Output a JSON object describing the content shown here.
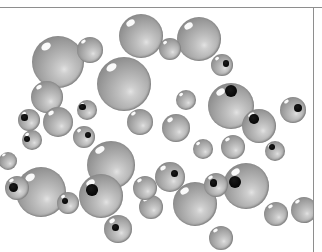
{
  "figure": {
    "kind": "space-filling-molecular-model",
    "caption": "",
    "background_color": "#ffffff",
    "border_color": "#8e8e8e",
    "sphere_base_color": "#a8a8a8",
    "sphere_highlight_color": "#ffffff",
    "sphere_shadow_color": "#6e6e6e",
    "pit_color": "#000000",
    "frame": {
      "top_rule_y": 7,
      "right_rule_x": 313,
      "width": 322,
      "height": 252
    },
    "atom_count": 38,
    "atoms": [
      {
        "id": "a01",
        "cx": 58,
        "cy": 62,
        "r": 26,
        "pit": null
      },
      {
        "id": "a02",
        "cx": 90,
        "cy": 50,
        "r": 13,
        "pit": null
      },
      {
        "id": "a03",
        "cx": 47,
        "cy": 97,
        "r": 16,
        "pit": null
      },
      {
        "id": "a04",
        "cx": 29,
        "cy": 120,
        "r": 11,
        "pit": {
          "ax": 30,
          "ay": 38,
          "ar": 30
        }
      },
      {
        "id": "a05",
        "cx": 58,
        "cy": 122,
        "r": 15,
        "pit": null
      },
      {
        "id": "a06",
        "cx": 87,
        "cy": 110,
        "r": 10,
        "pit": {
          "ax": 28,
          "ay": 36,
          "ar": 32
        }
      },
      {
        "id": "a07",
        "cx": 124,
        "cy": 84,
        "r": 27,
        "pit": null
      },
      {
        "id": "a08",
        "cx": 141,
        "cy": 36,
        "r": 22,
        "pit": null
      },
      {
        "id": "a09",
        "cx": 170,
        "cy": 49,
        "r": 11,
        "pit": null
      },
      {
        "id": "a10",
        "cx": 199,
        "cy": 39,
        "r": 22,
        "pit": null
      },
      {
        "id": "a11",
        "cx": 222,
        "cy": 65,
        "r": 11,
        "pit": {
          "ax": 68,
          "ay": 42,
          "ar": 30
        }
      },
      {
        "id": "a12",
        "cx": 186,
        "cy": 100,
        "r": 10,
        "pit": null
      },
      {
        "id": "a13",
        "cx": 140,
        "cy": 122,
        "r": 13,
        "pit": null
      },
      {
        "id": "a14",
        "cx": 176,
        "cy": 128,
        "r": 14,
        "pit": null
      },
      {
        "id": "a15",
        "cx": 231,
        "cy": 106,
        "r": 23,
        "pit": {
          "ax": 50,
          "ay": 18,
          "ar": 26
        }
      },
      {
        "id": "a16",
        "cx": 259,
        "cy": 126,
        "r": 17,
        "pit": {
          "ax": 36,
          "ay": 30,
          "ar": 28
        }
      },
      {
        "id": "a17",
        "cx": 293,
        "cy": 110,
        "r": 13,
        "pit": {
          "ax": 70,
          "ay": 42,
          "ar": 30
        }
      },
      {
        "id": "a18",
        "cx": 275,
        "cy": 151,
        "r": 10,
        "pit": {
          "ax": 34,
          "ay": 30,
          "ar": 30
        }
      },
      {
        "id": "a19",
        "cx": 32,
        "cy": 140,
        "r": 10,
        "pit": {
          "ax": 26,
          "ay": 44,
          "ar": 32
        }
      },
      {
        "id": "a20",
        "cx": 84,
        "cy": 137,
        "r": 11,
        "pit": {
          "ax": 68,
          "ay": 40,
          "ar": 30
        }
      },
      {
        "id": "a21",
        "cx": 41,
        "cy": 192,
        "r": 25,
        "pit": null
      },
      {
        "id": "a22",
        "cx": 17,
        "cy": 188,
        "r": 12,
        "pit": {
          "ax": 36,
          "ay": 48,
          "ar": 40
        }
      },
      {
        "id": "a23",
        "cx": 111,
        "cy": 165,
        "r": 24,
        "pit": null
      },
      {
        "id": "a24",
        "cx": 101,
        "cy": 196,
        "r": 22,
        "pit": {
          "ax": 30,
          "ay": 36,
          "ar": 26
        }
      },
      {
        "id": "a25",
        "cx": 68,
        "cy": 203,
        "r": 11,
        "pit": {
          "ax": 36,
          "ay": 40,
          "ar": 30
        }
      },
      {
        "id": "a26",
        "cx": 118,
        "cy": 229,
        "r": 14,
        "pit": {
          "ax": 40,
          "ay": 44,
          "ar": 26
        }
      },
      {
        "id": "a27",
        "cx": 151,
        "cy": 207,
        "r": 12,
        "pit": null
      },
      {
        "id": "a28",
        "cx": 170,
        "cy": 177,
        "r": 15,
        "pit": {
          "ax": 66,
          "ay": 38,
          "ar": 24
        }
      },
      {
        "id": "a29",
        "cx": 145,
        "cy": 188,
        "r": 12,
        "pit": null
      },
      {
        "id": "a30",
        "cx": 195,
        "cy": 204,
        "r": 22,
        "pit": null
      },
      {
        "id": "a31",
        "cx": 216,
        "cy": 185,
        "r": 12,
        "pit": {
          "ax": 38,
          "ay": 42,
          "ar": 30
        }
      },
      {
        "id": "a32",
        "cx": 221,
        "cy": 238,
        "r": 12,
        "pit": null
      },
      {
        "id": "a33",
        "cx": 246,
        "cy": 186,
        "r": 23,
        "pit": {
          "ax": 26,
          "ay": 42,
          "ar": 26
        }
      },
      {
        "id": "a34",
        "cx": 276,
        "cy": 214,
        "r": 12,
        "pit": null
      },
      {
        "id": "a35",
        "cx": 233,
        "cy": 147,
        "r": 12,
        "pit": null
      },
      {
        "id": "a36",
        "cx": 203,
        "cy": 149,
        "r": 10,
        "pit": null
      },
      {
        "id": "a37",
        "cx": 304,
        "cy": 210,
        "r": 13,
        "pit": null
      },
      {
        "id": "a38",
        "cx": 8,
        "cy": 161,
        "r": 9,
        "pit": null
      }
    ]
  }
}
